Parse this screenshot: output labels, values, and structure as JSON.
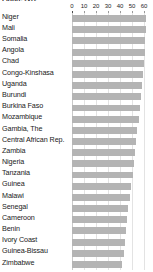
{
  "figure": {
    "title": "Figure 2-12"
  },
  "chart_data": {
    "type": "bar",
    "orientation": "horizontal",
    "title": "Figure 2-12",
    "xlabel": "",
    "ylabel": "",
    "xlim": [
      0,
      65
    ],
    "ticks": [
      0,
      10,
      20,
      30,
      40,
      50,
      60
    ],
    "grid": true,
    "legend": false,
    "bar_color": "#b4b4b4",
    "categories": [
      "Niger",
      "Mali",
      "Somalia",
      "Angola",
      "Chad",
      "Congo-Kinshasa",
      "Uganda",
      "Burundi",
      "Burkina Faso",
      "Mozambique",
      "Gambia, The",
      "Central African Rep.",
      "Zambia",
      "Nigeria",
      "Tanzania",
      "Guinea",
      "Malawi",
      "Senegal",
      "Cameroon",
      "Benin",
      "Ivory Coast",
      "Guinea-Bissau",
      "Zimbabwe"
    ],
    "values": [
      62.0,
      61.5,
      61.0,
      60.5,
      60.0,
      59.5,
      58.5,
      57.5,
      56.5,
      55.5,
      54.5,
      53.5,
      52.5,
      51.5,
      50.5,
      49.5,
      48.5,
      47.0,
      46.0,
      45.0,
      44.0,
      43.0,
      42.0
    ]
  }
}
